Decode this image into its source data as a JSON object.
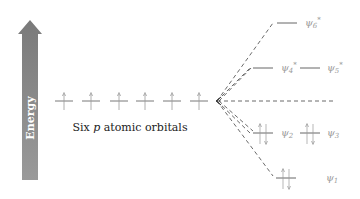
{
  "energy_axis": {
    "label": "Energy",
    "color": "#808080"
  },
  "atomic_orbitals": {
    "caption_prefix": "Six ",
    "caption_p": "p",
    "caption_suffix": " atomic orbitals",
    "count": 6,
    "electrons_each": 1
  },
  "molecular_orbitals": [
    {
      "name": "ψ6*",
      "sym": "ψ",
      "sub": "6",
      "star": "*",
      "electrons": 0
    },
    {
      "name": "ψ4*",
      "sym": "ψ",
      "sub": "4",
      "star": "*",
      "electrons": 0
    },
    {
      "name": "ψ5*",
      "sym": "ψ",
      "sub": "5",
      "star": "*",
      "electrons": 0
    },
    {
      "name": "ψ2",
      "sym": "ψ",
      "sub": "2",
      "star": "",
      "electrons": 2
    },
    {
      "name": "ψ3",
      "sym": "ψ",
      "sub": "3",
      "star": "",
      "electrons": 2
    },
    {
      "name": "ψ1",
      "sym": "ψ",
      "sub": "1",
      "star": "",
      "electrons": 2
    }
  ],
  "colors": {
    "line": "#555555",
    "dash": "#444444",
    "label": "#9a9a9a",
    "arrow_fill": "#808080"
  }
}
